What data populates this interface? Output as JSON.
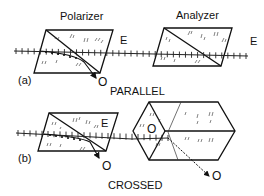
{
  "diagram": {
    "title_a_left": "Polarizer",
    "title_a_right": "Analyzer",
    "part_a_label": "(a)",
    "part_b_label": "(b)",
    "caption_a": "PARALLEL",
    "caption_b": "CROSSED",
    "ray_e": "E",
    "ray_o": "O"
  }
}
